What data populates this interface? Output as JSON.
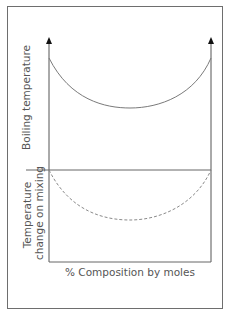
{
  "diagram": {
    "upper_panel": {
      "ylabel": "Boiling temperature",
      "curve": "solid",
      "curve_color": "#7a7a7a"
    },
    "lower_panel": {
      "ylabel_line1": "Temperature",
      "ylabel_line2": "change on mixing",
      "curve": "dashed",
      "curve_color": "#8a8a8a"
    },
    "xlabel": "% Composition by moles"
  }
}
